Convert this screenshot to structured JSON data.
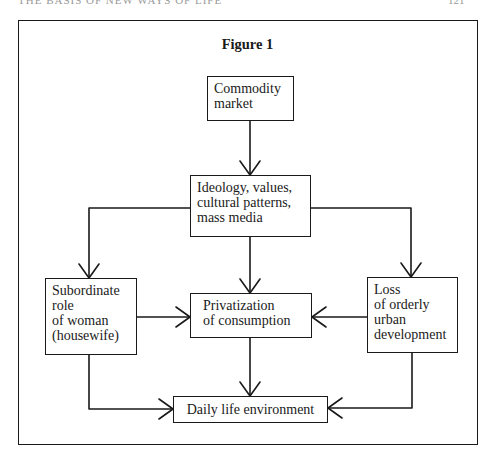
{
  "page": {
    "running_head": "THE BASIS OF NEW WAYS OF LIFE",
    "page_number": "121"
  },
  "figure": {
    "title": "Figure 1",
    "nodes": {
      "commodity_market": "Commodity\nmarket",
      "ideology": "Ideology, values,\ncultural patterns,\nmass media",
      "subordinate_role": "Subordinate\nrole\nof woman\n(housewife)",
      "privatization": "Privatization\nof consumption",
      "loss_urban": "Loss\nof orderly\nurban\ndevelopment",
      "daily_life": "Daily life environment"
    },
    "edges": [
      {
        "from": "commodity_market",
        "to": "ideology"
      },
      {
        "from": "ideology",
        "to": "subordinate_role"
      },
      {
        "from": "ideology",
        "to": "privatization"
      },
      {
        "from": "ideology",
        "to": "loss_urban"
      },
      {
        "from": "subordinate_role",
        "to": "privatization"
      },
      {
        "from": "loss_urban",
        "to": "privatization"
      },
      {
        "from": "subordinate_role",
        "to": "daily_life"
      },
      {
        "from": "privatization",
        "to": "daily_life"
      },
      {
        "from": "loss_urban",
        "to": "daily_life"
      }
    ]
  }
}
